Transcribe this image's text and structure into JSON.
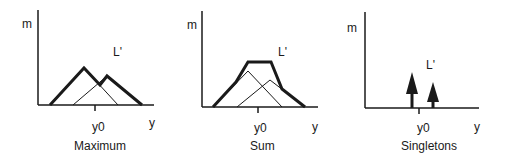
{
  "panels": [
    {
      "id": "maximum",
      "caption": "Maximum",
      "y_axis_label": "m",
      "x_axis_label": "y",
      "tick_label": "y0",
      "set_label": "L'",
      "description": "Two overlapping triangular membership functions; result is their maximum envelope (bold)"
    },
    {
      "id": "sum",
      "caption": "Sum",
      "y_axis_label": "m",
      "x_axis_label": "y",
      "tick_label": "y0",
      "set_label": "L'",
      "description": "Two overlapping triangular membership functions; result is their sum (bold trapezoid-like envelope)"
    },
    {
      "id": "singletons",
      "caption": "Singletons",
      "y_axis_label": "m",
      "x_axis_label": "y",
      "tick_label": "y0",
      "set_label": "L'",
      "description": "Two singleton arrows of different heights"
    }
  ],
  "colors": {
    "ink": "#1a1a1a",
    "background": "#ffffff"
  }
}
